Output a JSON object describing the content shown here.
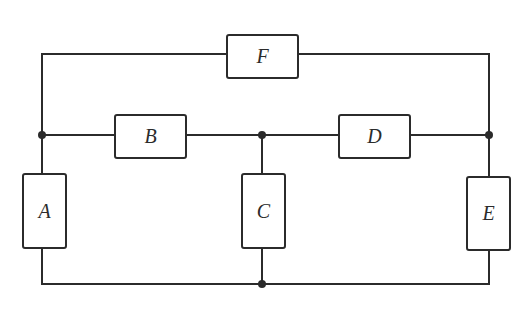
{
  "diagram": {
    "type": "circuit",
    "colors": {
      "line": "#2b2b2b",
      "background": "#ffffff"
    },
    "components": [
      {
        "id": "F",
        "label": "F",
        "x": 227,
        "y": 35,
        "w": 71,
        "h": 43
      },
      {
        "id": "B",
        "label": "B",
        "x": 115,
        "y": 115,
        "w": 71,
        "h": 43
      },
      {
        "id": "D",
        "label": "D",
        "x": 339,
        "y": 115,
        "w": 71,
        "h": 43
      },
      {
        "id": "A",
        "label": "A",
        "x": 23,
        "y": 174,
        "w": 43,
        "h": 74
      },
      {
        "id": "C",
        "label": "C",
        "x": 242,
        "y": 174,
        "w": 43,
        "h": 74
      },
      {
        "id": "E",
        "label": "E",
        "x": 467,
        "y": 177,
        "w": 43,
        "h": 73
      }
    ],
    "junctions": [
      {
        "x": 42,
        "y": 135
      },
      {
        "x": 262,
        "y": 135
      },
      {
        "x": 489,
        "y": 135
      },
      {
        "x": 262,
        "y": 284
      }
    ]
  }
}
